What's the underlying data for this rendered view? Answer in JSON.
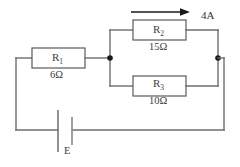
{
  "figure": {
    "type": "circuit-diagram",
    "width": 240,
    "height": 167,
    "background_color": "#ffffff",
    "wire_color": "#6e6e6e",
    "text_color": "#3d3d3d",
    "node_color": "#1a1a1a"
  },
  "components": {
    "r1": {
      "name": "R",
      "subscript": "1",
      "value": "6Ω",
      "resistance_ohms": 6,
      "position": "series-top-left"
    },
    "r2": {
      "name": "R",
      "subscript": "2",
      "value": "15Ω",
      "resistance_ohms": 15,
      "position": "parallel-upper-branch"
    },
    "r3": {
      "name": "R",
      "subscript": "3",
      "value": "10Ω",
      "resistance_ohms": 10,
      "position": "parallel-lower-branch"
    },
    "battery": {
      "label": "E",
      "position": "bottom",
      "symbol": "battery-cell-icon"
    }
  },
  "annotations": {
    "current": {
      "label": "4A",
      "magnitude": 4,
      "unit": "A",
      "direction": "right",
      "applies_to": "r2-branch"
    }
  },
  "nodes": {
    "left_junction": "node-a",
    "right_junction": "node-b"
  }
}
